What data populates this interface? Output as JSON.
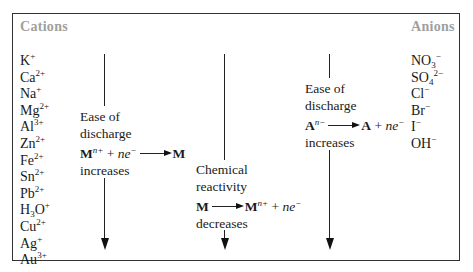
{
  "headers": {
    "cations": "Cations",
    "anions": "Anions"
  },
  "cations": [
    {
      "base": "K",
      "sub": "",
      "sup": "+"
    },
    {
      "base": "Ca",
      "sub": "",
      "sup": "2+"
    },
    {
      "base": "Na",
      "sub": "",
      "sup": "+"
    },
    {
      "base": "Mg",
      "sub": "",
      "sup": "2+"
    },
    {
      "base": "Al",
      "sub": "",
      "sup": "3+"
    },
    {
      "base": "Zn",
      "sub": "",
      "sup": "2+"
    },
    {
      "base": "Fe",
      "sub": "",
      "sup": "2+"
    },
    {
      "base": "Sn",
      "sub": "",
      "sup": "2+"
    },
    {
      "base": "Pb",
      "sub": "",
      "sup": "2+"
    },
    {
      "base": "H",
      "sub": "3",
      "tail": "O",
      "sup": "+"
    },
    {
      "base": "Cu",
      "sub": "",
      "sup": "2+"
    },
    {
      "base": "Ag",
      "sub": "",
      "sup": "+"
    },
    {
      "base": "Au",
      "sub": "",
      "sup": "3+"
    }
  ],
  "anions": [
    {
      "base": "NO",
      "sub": "3",
      "sup": "−"
    },
    {
      "base": "SO",
      "sub": "4",
      "sup": "2−"
    },
    {
      "base": "Cl",
      "sub": "",
      "sup": "−"
    },
    {
      "base": "Br",
      "sub": "",
      "sup": "−"
    },
    {
      "base": "I",
      "sub": "",
      "sup": "−"
    },
    {
      "base": "OH",
      "sub": "",
      "sup": "−"
    }
  ],
  "arrows": [
    {
      "id": "cation-discharge",
      "line1": "Ease of",
      "line2": "discharge",
      "eq_left": "M",
      "eq_left_sup": "n+",
      "eq_plus": " + ",
      "eq_ne": "ne",
      "eq_ne_sup": "−",
      "eq_right": "M",
      "line4": "increases"
    },
    {
      "id": "chemical-reactivity",
      "line1": "Chemical",
      "line2": "reactivity",
      "eq_left": "M",
      "eq_right": "M",
      "eq_right_sup": "n+",
      "eq_plus": " + ",
      "eq_ne": "ne",
      "eq_ne_sup": "−",
      "line4": "decreases"
    },
    {
      "id": "anion-discharge",
      "line1": "Ease of",
      "line2": "discharge",
      "eq_left": "A",
      "eq_left_sup": "n−",
      "eq_right": "A",
      "eq_plus": " + ",
      "eq_ne": "ne",
      "eq_ne_sup": "−",
      "line4": "increases"
    }
  ]
}
